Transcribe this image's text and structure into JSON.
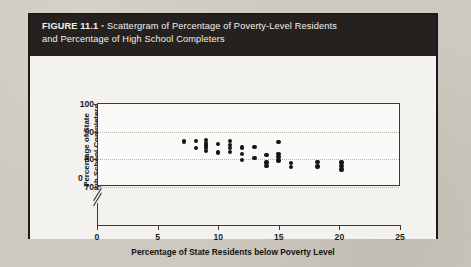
{
  "figure": {
    "number": "FIGURE 11.1",
    "bullet": "▪",
    "caption_line1": "Scattergram of Percentage of Poverty-Level Residents",
    "caption_line2": "and Percentage of High School Completers"
  },
  "colors": {
    "caption_bar": "#25211f",
    "caption_text": "#f3f1ee",
    "figure_border": "#1a1a1a",
    "page_background": "#cdc9c0",
    "plot_background": "#fbfaf8",
    "axis": "#3a3a3a",
    "gridline": "#b8b4ae",
    "dot": "#141414"
  },
  "chart_data": {
    "type": "scatter",
    "title": "Scattergram of Percentage of Poverty-Level Residents and Percentage of High School Completers",
    "xlabel": "Percentage of State Residents below Poverty Level",
    "ylabel": "Percentage of State High School Completers",
    "ylabel_line1": "Percentage of State",
    "ylabel_line2": "High School Completers",
    "xlim": [
      0,
      25
    ],
    "ylim": [
      70,
      100
    ],
    "y_axis_break": true,
    "y_axis_break_note": "axis broken between 0 and 70",
    "xticks": [
      0,
      5,
      10,
      15,
      20,
      25
    ],
    "yticks": [
      70,
      80,
      90,
      100
    ],
    "xtick_labels": [
      "0",
      "5",
      "10",
      "15",
      "20",
      "25"
    ],
    "ytick_labels": [
      "70",
      "80",
      "90",
      "100"
    ],
    "gridlines": [
      70,
      80,
      90
    ],
    "grid": true,
    "legend": null,
    "points": [
      {
        "x": 7.1,
        "y": 86.5
      },
      {
        "x": 8.1,
        "y": 86.6
      },
      {
        "x": 8.1,
        "y": 84.2
      },
      {
        "x": 8.9,
        "y": 87.0
      },
      {
        "x": 8.9,
        "y": 86.0
      },
      {
        "x": 8.9,
        "y": 85.0
      },
      {
        "x": 8.9,
        "y": 84.0
      },
      {
        "x": 8.9,
        "y": 83.0
      },
      {
        "x": 9.9,
        "y": 85.5
      },
      {
        "x": 9.9,
        "y": 82.5
      },
      {
        "x": 10.9,
        "y": 86.6
      },
      {
        "x": 10.9,
        "y": 85.2
      },
      {
        "x": 10.9,
        "y": 84.0
      },
      {
        "x": 10.9,
        "y": 82.6
      },
      {
        "x": 11.9,
        "y": 84.3
      },
      {
        "x": 11.9,
        "y": 82.0
      },
      {
        "x": 11.9,
        "y": 79.7
      },
      {
        "x": 12.9,
        "y": 84.5
      },
      {
        "x": 12.9,
        "y": 80.5
      },
      {
        "x": 13.9,
        "y": 81.5
      },
      {
        "x": 13.9,
        "y": 78.8
      },
      {
        "x": 13.9,
        "y": 77.6
      },
      {
        "x": 14.9,
        "y": 86.3
      },
      {
        "x": 14.9,
        "y": 82.0
      },
      {
        "x": 14.9,
        "y": 80.8
      },
      {
        "x": 14.9,
        "y": 79.6
      },
      {
        "x": 15.9,
        "y": 78.7
      },
      {
        "x": 15.9,
        "y": 77.3
      },
      {
        "x": 18.1,
        "y": 79.0
      },
      {
        "x": 18.1,
        "y": 77.4
      },
      {
        "x": 20.1,
        "y": 78.9
      },
      {
        "x": 20.1,
        "y": 77.5
      },
      {
        "x": 20.1,
        "y": 76.3
      }
    ]
  }
}
